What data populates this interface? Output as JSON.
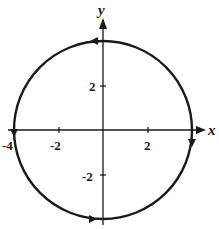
{
  "diagram": {
    "type": "parametric-curve",
    "axes": {
      "x_label": "x",
      "y_label": "y",
      "x_ticks": [
        {
          "value": -4,
          "label": "-4"
        },
        {
          "value": -2,
          "label": "-2"
        },
        {
          "value": 2,
          "label": "2"
        },
        {
          "value": 4,
          "label": "4"
        }
      ],
      "y_ticks": [
        {
          "value": 2,
          "label": "2"
        },
        {
          "value": -2,
          "label": "-2"
        }
      ]
    },
    "curve": {
      "shape": "circle",
      "center": [
        0,
        0
      ],
      "radius": 4,
      "orientation": "counterclockwise",
      "arrows_at": [
        [
          0,
          4
        ],
        [
          4,
          0
        ],
        [
          0,
          -4
        ],
        [
          -4,
          0
        ]
      ]
    },
    "colors": {
      "ink": "#1a1a1a",
      "background": "#ffffff"
    }
  }
}
